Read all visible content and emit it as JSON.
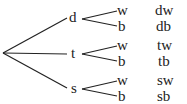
{
  "diagram": {
    "type": "tree",
    "level1": [
      "d",
      "t",
      "s"
    ],
    "level2": [
      [
        "w",
        "b"
      ],
      [
        "w",
        "b"
      ],
      [
        "w",
        "b"
      ]
    ],
    "outcomes": [
      [
        "dw",
        "db"
      ],
      [
        "tw",
        "tb"
      ],
      [
        "sw",
        "sb"
      ]
    ]
  }
}
